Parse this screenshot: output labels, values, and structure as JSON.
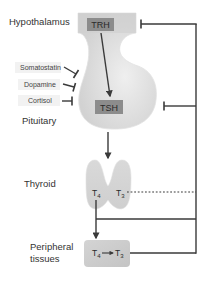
{
  "diagram": {
    "colors": {
      "line": "#4a4a4a",
      "gland_fill": "#d6d6d6",
      "gland_highlight": "#ededed",
      "hormone_box": "#8a8a8a",
      "label_box": "#f0f0f0",
      "text": "#333333"
    },
    "organs": {
      "hypothalamus": "Hypothalamus",
      "pituitary": "Pituitary",
      "thyroid": "Thyroid",
      "peripheral_line1": "Peripheral",
      "peripheral_line2": "tissues"
    },
    "hormones": {
      "trh": "TRH",
      "tsh": "TSH",
      "t4": "T",
      "t4_sub": "4",
      "t3": "T",
      "t3_sub": "3"
    },
    "inhibitors": [
      {
        "label": "Somatostatin"
      },
      {
        "label": "Dopamine"
      },
      {
        "label": "Cortisol"
      }
    ],
    "edges": [
      {
        "from": "TRH",
        "to": "TSH",
        "type": "stimulate"
      },
      {
        "from": "TSH",
        "to": "Thyroid",
        "type": "stimulate"
      },
      {
        "from": "T4",
        "to": "Peripheral tissues",
        "type": "stimulate"
      },
      {
        "from": "T4 (peripheral)",
        "to": "T3",
        "type": "conversion"
      },
      {
        "from": "T3 (thyroid)",
        "to": "feedback",
        "type": "dotted"
      },
      {
        "from": "feedback",
        "to": "Hypothalamus",
        "type": "inhibit"
      },
      {
        "from": "feedback",
        "to": "Pituitary",
        "type": "inhibit"
      },
      {
        "from": "Somatostatin",
        "to": "Pituitary",
        "type": "inhibit"
      },
      {
        "from": "Dopamine",
        "to": "Pituitary",
        "type": "inhibit"
      },
      {
        "from": "Cortisol",
        "to": "Pituitary",
        "type": "inhibit"
      }
    ]
  }
}
